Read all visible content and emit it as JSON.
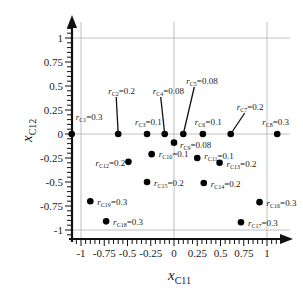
{
  "chart_data": {
    "type": "scatter",
    "title": "",
    "xlabel": "x_C11",
    "ylabel": "x_C12",
    "xlabel_main": "x",
    "xlabel_sub": "C11",
    "ylabel_main": "x",
    "ylabel_sub": "C12",
    "xlim": [
      -1.1,
      1.15
    ],
    "ylim": [
      -1.1,
      1.2
    ],
    "x_ticks": [
      -1,
      -0.75,
      -0.5,
      -0.25,
      0,
      0.25,
      0.5,
      0.75,
      1
    ],
    "x_tick_labels": [
      "-1",
      "-0.75",
      "-0.5",
      "-0.25",
      "0",
      "0.25",
      "0.5",
      "0.75",
      "1"
    ],
    "y_ticks": [
      1,
      0.75,
      0.5,
      0.25,
      0,
      -0.25,
      -0.5,
      -0.75,
      -1
    ],
    "y_tick_labels": [
      "1",
      "0.75",
      "0.5",
      "0.25",
      "0",
      "-0.25",
      "-0.5",
      "-0.75",
      "-1"
    ],
    "grid": "lines at x=-1,0,1 and y=-1,0,1",
    "legend": "none",
    "points": [
      {
        "name": "C1",
        "x": -1.1,
        "y": 0,
        "label": "r",
        "sub": "C1",
        "value": "=0.3"
      },
      {
        "name": "C2",
        "x": -0.6,
        "y": 0,
        "label": "r",
        "sub": "C2",
        "value": "=0.2"
      },
      {
        "name": "C3",
        "x": -0.29,
        "y": 0,
        "label": "r",
        "sub": "C3",
        "value": "=0.1"
      },
      {
        "name": "C4",
        "x": -0.1,
        "y": 0,
        "label": "r",
        "sub": "C4",
        "value": "=0.08"
      },
      {
        "name": "C5",
        "x": 0.1,
        "y": 0,
        "label": "r",
        "sub": "C5",
        "value": "=0.08"
      },
      {
        "name": "C6",
        "x": 0.31,
        "y": 0,
        "label": "r",
        "sub": "C6",
        "value": "=0.1"
      },
      {
        "name": "C7",
        "x": 0.61,
        "y": 0,
        "label": "r",
        "sub": "C7",
        "value": "=0.2"
      },
      {
        "name": "C8",
        "x": 1.11,
        "y": 0,
        "label": "r",
        "sub": "C8",
        "value": "=0.3"
      },
      {
        "name": "C9",
        "x": 0.0,
        "y": -0.09,
        "label": "r",
        "sub": "C9",
        "value": "=0.08"
      },
      {
        "name": "C10",
        "x": -0.24,
        "y": -0.21,
        "label": "r",
        "sub": "C10",
        "value": "=0.1"
      },
      {
        "name": "C11",
        "x": 0.25,
        "y": -0.25,
        "label": "r",
        "sub": "C11",
        "value": "=0.1"
      },
      {
        "name": "C12",
        "x": -0.49,
        "y": -0.29,
        "label": "r",
        "sub": "C12",
        "value": "=0.2"
      },
      {
        "name": "C13",
        "x": 0.49,
        "y": -0.3,
        "label": "r",
        "sub": "C13",
        "value": "=0.2"
      },
      {
        "name": "C14",
        "x": 0.32,
        "y": -0.51,
        "label": "r",
        "sub": "C14",
        "value": "=0.2"
      },
      {
        "name": "C15",
        "x": -0.29,
        "y": -0.5,
        "label": "r",
        "sub": "C15",
        "value": "=0.2"
      },
      {
        "name": "C16",
        "x": 0.92,
        "y": -0.71,
        "label": "r",
        "sub": "C16",
        "value": "=0.3"
      },
      {
        "name": "C17",
        "x": 0.72,
        "y": -0.92,
        "label": "r",
        "sub": "C17",
        "value": "=0.3"
      },
      {
        "name": "C18",
        "x": -0.73,
        "y": -0.91,
        "label": "r",
        "sub": "C18",
        "value": "=0.3"
      },
      {
        "name": "C19",
        "x": -0.9,
        "y": -0.7,
        "label": "r",
        "sub": "C19",
        "value": "=0.3"
      }
    ]
  },
  "layout": {
    "x0_px": 174,
    "x_scale_px": 93,
    "y0_px": 134,
    "y_scale_px": 96,
    "label_offsets": {
      "C1": {
        "dx": 1,
        "dy": -17,
        "leader": false
      },
      "C2": {
        "dx": -10,
        "dy": -40,
        "leader": true
      },
      "C3": {
        "dx": -15,
        "dy": -12,
        "leader": false
      },
      "C4": {
        "dx": -12,
        "dy": -40,
        "leader": true
      },
      "C5": {
        "dx": 3,
        "dy": -50,
        "leader": true
      },
      "C6": {
        "dx": -11,
        "dy": -12,
        "leader": false
      },
      "C7": {
        "dx": 6,
        "dy": -24,
        "leader": true
      },
      "C8": {
        "dx": -18,
        "dy": -12,
        "leader": false
      },
      "C9": {
        "dx": 3,
        "dy": 2,
        "leader": false
      },
      "C10": {
        "dx": 4,
        "dy": 0,
        "leader": false
      },
      "C11": {
        "dx": 4,
        "dy": -2,
        "leader": false
      },
      "C12": {
        "dx": -36,
        "dy": 1,
        "leader": false
      },
      "C13": {
        "dx": 4,
        "dy": 1,
        "leader": false
      },
      "C14": {
        "dx": 4,
        "dy": 1,
        "leader": false
      },
      "C15": {
        "dx": 4,
        "dy": 1,
        "leader": false
      },
      "C16": {
        "dx": 4,
        "dy": 1,
        "leader": false
      },
      "C17": {
        "dx": 4,
        "dy": 1,
        "leader": false
      },
      "C18": {
        "dx": 4,
        "dy": 1,
        "leader": false
      },
      "C19": {
        "dx": 4,
        "dy": 1,
        "leader": false
      }
    }
  },
  "colors": {
    "axis": "#111111",
    "grid": "#b0b0b0",
    "point": "#000000",
    "text": "#222222"
  }
}
